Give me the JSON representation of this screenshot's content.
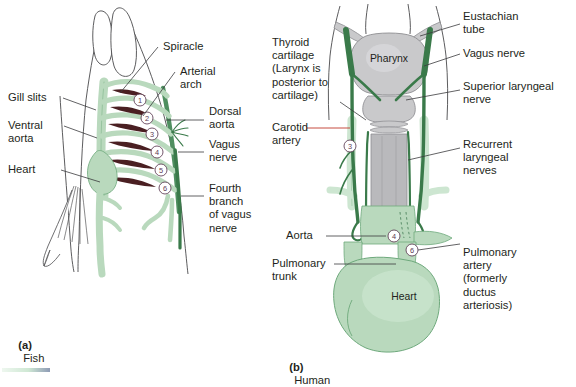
{
  "figure": {
    "panels": [
      {
        "id": "a",
        "marker": "(a)",
        "caption": "Fish"
      },
      {
        "id": "b",
        "marker": "(b)",
        "caption": "Human"
      }
    ]
  },
  "colors": {
    "vessel_fill": "#b9d9bd",
    "vessel_fill_light": "#cde6d1",
    "vessel_outline": "#5d9c6c",
    "nerve_dark_green": "#3a7a4a",
    "gill_filament": "#4a1f22",
    "cartilage_grey": "#c9c9cb",
    "cartilage_outline": "#8e8e92",
    "leader_line": "#3b3b3d",
    "carotid_leader": "#c0392b",
    "number_ring": "#5b3a52",
    "text": "#231f20",
    "background": "#ffffff"
  },
  "fish": {
    "labels": [
      {
        "name": "spiracle",
        "text": "Spiracle"
      },
      {
        "name": "arterial-arch",
        "text": "Arterial\narch"
      },
      {
        "name": "gill-slits",
        "text": "Gill slits"
      },
      {
        "name": "ventral-aorta",
        "text": "Ventral\naorta"
      },
      {
        "name": "dorsal-aorta",
        "text": "Dorsal\naorta"
      },
      {
        "name": "vagus-nerve",
        "text": "Vagus\nnerve"
      },
      {
        "name": "heart",
        "text": "Heart"
      },
      {
        "name": "fourth-branch-vagus",
        "text": "Fourth\nbranch\nof vagus\nnerve"
      }
    ],
    "arch_numbers": [
      "1",
      "2",
      "3",
      "4",
      "5",
      "6"
    ]
  },
  "human": {
    "labels": [
      {
        "name": "thyroid-cartilage",
        "text": "Thyroid\ncartilage\n(Larynx is\nposterior to\ncartilage)"
      },
      {
        "name": "carotid-artery",
        "text": "Carotid\nartery"
      },
      {
        "name": "aorta",
        "text": "Aorta"
      },
      {
        "name": "pulmonary-trunk",
        "text": "Pulmonary\ntrunk"
      },
      {
        "name": "eustachian-tube",
        "text": "Eustachian\ntube"
      },
      {
        "name": "vagus-nerve",
        "text": "Vagus nerve"
      },
      {
        "name": "superior-laryngeal-nerve",
        "text": "Superior laryngeal\nnerve"
      },
      {
        "name": "recurrent-laryngeal-nerves",
        "text": "Recurrent\nlaryngeal\nnerves"
      },
      {
        "name": "pulmonary-artery",
        "text": "Pulmonary\nartery\n(formerly\nductus\narteriosis)"
      }
    ],
    "organ_labels": [
      {
        "name": "pharynx",
        "text": "Pharynx"
      },
      {
        "name": "heart",
        "text": "Heart"
      }
    ],
    "arch_numbers": [
      "3",
      "4",
      "6"
    ]
  }
}
